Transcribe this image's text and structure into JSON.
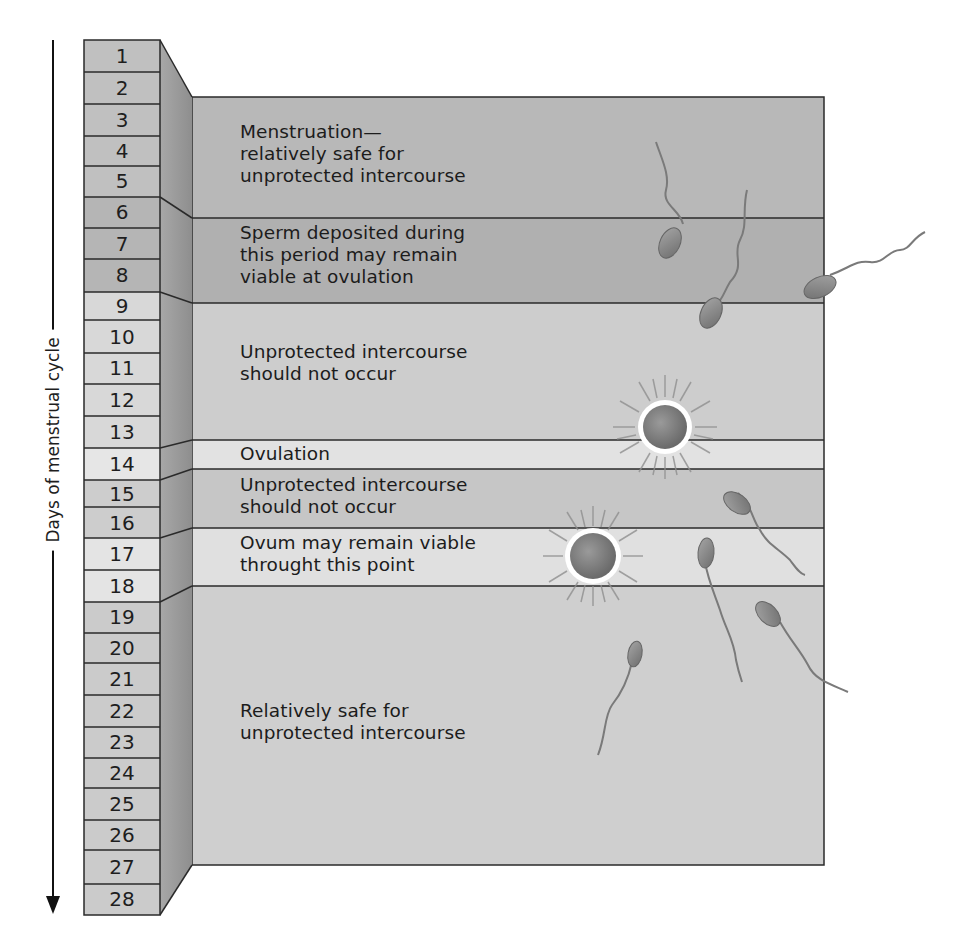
{
  "figure": {
    "axis_label": "Days of menstrual cycle",
    "axis_direction": "down",
    "days": [
      "1",
      "2",
      "3",
      "4",
      "5",
      "6",
      "7",
      "8",
      "9",
      "10",
      "11",
      "12",
      "13",
      "14",
      "15",
      "16",
      "17",
      "18",
      "19",
      "20",
      "21",
      "22",
      "23",
      "24",
      "25",
      "26",
      "27",
      "28"
    ],
    "bands": [
      {
        "id": "menstruation",
        "days": "1-5",
        "text": "Menstruation—\nrelatively safe for\nunprotected intercourse"
      },
      {
        "id": "sperm-viable",
        "days": "6-8",
        "text": "Sperm deposited during\nthis period may remain\nviable at ovulation"
      },
      {
        "id": "pre-ovulation-unsafe",
        "days": "9-13",
        "text": "Unprotected intercourse\nshould not occur"
      },
      {
        "id": "ovulation",
        "days": "14",
        "text": "Ovulation"
      },
      {
        "id": "post-ovulation-unsafe",
        "days": "15-16",
        "text": "Unprotected intercourse\nshould not occur"
      },
      {
        "id": "ovum-viable",
        "days": "17-18",
        "text": "Ovum may remain viable\nthrought this point"
      },
      {
        "id": "luteal-safe",
        "days": "19-28",
        "text": "Relatively safe for\nunprotected intercourse"
      }
    ],
    "colors": {
      "dark_band": "#b4b4b4",
      "light_band": "#d9d9d9",
      "side_face": "#9a9a9a",
      "line": "#2a2a2a",
      "ovum": "#7d7d7d",
      "sperm": "#8a8a8a"
    },
    "illustrations": [
      "sperm-icon",
      "ovum-icon"
    ]
  }
}
